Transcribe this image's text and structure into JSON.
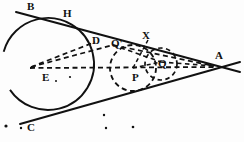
{
  "figure": {
    "kind": "geometry-diagram",
    "width": 244,
    "height": 142,
    "stroke_color": "#111111",
    "background_color": "#fdfdfd",
    "labels": [
      {
        "id": "label-B",
        "text": "B",
        "x": 27,
        "y": 1,
        "size": 11
      },
      {
        "id": "label-H",
        "text": "H",
        "x": 63,
        "y": 8,
        "size": 11
      },
      {
        "id": "label-D",
        "text": "D",
        "x": 92,
        "y": 35,
        "size": 11
      },
      {
        "id": "label-Qp",
        "text": "Q'",
        "x": 111,
        "y": 38,
        "size": 11
      },
      {
        "id": "label-X",
        "text": "X",
        "x": 142,
        "y": 30,
        "size": 11
      },
      {
        "id": "label-Q",
        "text": "Q",
        "x": 158,
        "y": 58,
        "size": 11
      },
      {
        "id": "label-A",
        "text": "A",
        "x": 215,
        "y": 50,
        "size": 11
      },
      {
        "id": "label-E",
        "text": "E",
        "x": 42,
        "y": 72,
        "size": 11
      },
      {
        "id": "label-P",
        "text": "P",
        "x": 132,
        "y": 72,
        "size": 11
      },
      {
        "id": "label-C",
        "text": "C",
        "x": 27,
        "y": 122,
        "size": 11
      }
    ],
    "circles": [
      {
        "id": "circle-large-main",
        "style": "solid",
        "cx": 48,
        "cy": 64,
        "r": 46
      },
      {
        "id": "circle-incircle-P",
        "style": "dashed",
        "cx": 133,
        "cy": 68,
        "r": 23
      },
      {
        "id": "circle-small-Q",
        "style": "dashed",
        "cx": 161,
        "cy": 64,
        "r": 16
      }
    ],
    "tangent_lines": [
      {
        "id": "tangent-upper-BA",
        "x1": 16,
        "y1": 12,
        "x2": 240,
        "y2": 72
      },
      {
        "id": "tangent-lower-CA",
        "x1": 20,
        "y1": 124,
        "x2": 240,
        "y2": 62
      }
    ],
    "dashed_segments": [
      {
        "id": "chord-E-to-A",
        "x1": 30,
        "y1": 68,
        "x2": 214,
        "y2": 67
      },
      {
        "id": "ray-E-to-D",
        "x1": 31,
        "y1": 67,
        "x2": 95,
        "y2": 42
      },
      {
        "id": "ray-E-to-Qp",
        "x1": 31,
        "y1": 67,
        "x2": 113,
        "y2": 45
      },
      {
        "id": "ray-Qp-to-A",
        "x1": 113,
        "y1": 45,
        "x2": 214,
        "y2": 66
      },
      {
        "id": "ray-Qp-to-Q",
        "x1": 113,
        "y1": 45,
        "x2": 161,
        "y2": 62
      },
      {
        "id": "ray-Q-to-A",
        "x1": 161,
        "y1": 62,
        "x2": 214,
        "y2": 66
      },
      {
        "id": "ray-P-to-X",
        "x1": 133,
        "y1": 68,
        "x2": 148,
        "y2": 40
      },
      {
        "id": "ray-P-to-Q",
        "x1": 133,
        "y1": 68,
        "x2": 161,
        "y2": 62
      }
    ],
    "speckles": [
      {
        "id": "speckle-1",
        "cx": 6,
        "cy": 126,
        "r": 1.6
      },
      {
        "id": "speckle-2",
        "cx": 21,
        "cy": 128,
        "r": 1.2
      },
      {
        "id": "speckle-3",
        "cx": 70,
        "cy": 77,
        "r": 1.1
      },
      {
        "id": "speckle-4",
        "cx": 104,
        "cy": 115,
        "r": 1.2
      },
      {
        "id": "speckle-5",
        "cx": 106,
        "cy": 128,
        "r": 1.2
      },
      {
        "id": "speckle-6",
        "cx": 133,
        "cy": 127,
        "r": 1.3
      },
      {
        "id": "speckle-7",
        "cx": 56,
        "cy": 81,
        "r": 1.0
      }
    ]
  }
}
